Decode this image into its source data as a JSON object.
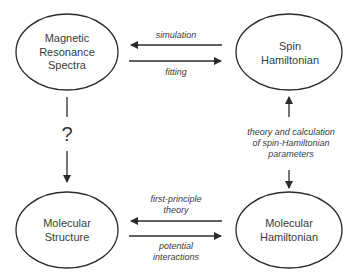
{
  "nodes": {
    "mr_spectra": {
      "line1": "Magnetic",
      "line2": "Resonance",
      "line3": "Spectra"
    },
    "spin_hamiltonian": {
      "line1": "Spin",
      "line2": "Hamiltonian"
    },
    "molecular_structure": {
      "line1": "Molecular",
      "line2": "Structure"
    },
    "molecular_hamiltonian": {
      "line1": "Molecular",
      "line2": "Hamiltonian"
    }
  },
  "edges": {
    "simulation": "simulation",
    "fitting": "fitting",
    "first_principle": {
      "line1": "first-principle",
      "line2": "theory"
    },
    "potential": {
      "line1": "potential",
      "line2": "interactions"
    },
    "theory_calc": {
      "line1": "theory and calculation",
      "line2": "of spin-Hamiltonian",
      "line3": "parameters"
    },
    "unknown": "?"
  },
  "colors": {
    "stroke": "#2b2b2b",
    "text": "#3a3a3a",
    "background": "#ffffff"
  }
}
